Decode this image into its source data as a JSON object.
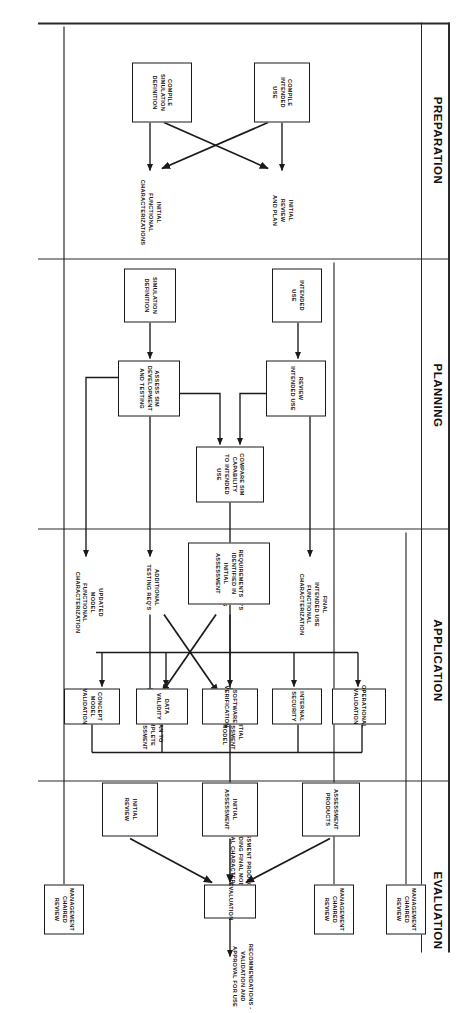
{
  "diagram": {
    "orientation": "rotated-90-clockwise",
    "phases": [
      {
        "id": "preparation",
        "label": "PREPARATION"
      },
      {
        "id": "planning",
        "label": "PLANNING"
      },
      {
        "id": "application",
        "label": "APPLICATION"
      },
      {
        "id": "evaluation",
        "label": "EVALUATION"
      }
    ],
    "review_gates": [
      {
        "id": "gate-preparation",
        "label": "MANAGEMENT\nCHAIRED\nREVIEW"
      },
      {
        "id": "gate-planning",
        "label": "MANAGEMENT\nCHAIRED\nREVIEW"
      },
      {
        "id": "gate-application",
        "label": "MANAGEMENT\nCHAIRED\nREVIEW"
      }
    ],
    "preparation": {
      "boxes": [
        {
          "id": "compile-simulation-definition",
          "label": "COMPILE\nSIMULATION\nDEFINITION"
        },
        {
          "id": "compile-intended-use",
          "label": "COMPILE\nINTENDED\nUSE"
        }
      ],
      "outputs": [
        {
          "id": "initial-functional-characterizations",
          "label": "INITIAL\nFUNCTIONAL\nCHARACTERIZATIONS"
        },
        {
          "id": "initial-review-and-plan",
          "label": "INITIAL\nREVIEW\nAND PLAN"
        }
      ]
    },
    "planning": {
      "boxes": [
        {
          "id": "simulation-definition",
          "label": "SIMULATION\nDEFINITION"
        },
        {
          "id": "intended-use",
          "label": "INTENDED\nUSE"
        },
        {
          "id": "assess-sim-development",
          "label": "ASSESS SIM\nDEVELOPMENT\nAND TESTING"
        },
        {
          "id": "review-intended-use",
          "label": "REVIEW\nINTENDED USE"
        },
        {
          "id": "compare-sim-capability",
          "label": "COMPARE SIM\nCAPABILITY\nTO INTENDED USE"
        }
      ],
      "outputs": [
        {
          "id": "updated-model-functional-characterization",
          "label": "UPDATED\nMODEL\nFUNCTIONAL\nCHARACTERIZATION"
        },
        {
          "id": "additional-testing-reqs",
          "label": "ADDITIONAL\nTESTING REQ'S"
        },
        {
          "id": "testing-reqs-to-meet-objectives",
          "label": "TESTING REQ'S\nTO MEET\nOBJECTIVES"
        },
        {
          "id": "final-intended-use-functional-characterization",
          "label": "FINAL\nINTENDED USE\nFUNCTIONAL\nCHARACTERIZATION"
        },
        {
          "id": "plan-to-complete-assessment",
          "label": "PLAN TO\nCOMPLETE\nASSESSMENT"
        },
        {
          "id": "initial-assessment-of-model",
          "label": "INITIAL\nASSESSMENT\nOF MODEL"
        }
      ]
    },
    "application": {
      "source": {
        "id": "requirements-identified",
        "label": "REQUIREMENTS IDENTIFIED IN\nINITIAL ASSESSMENT"
      },
      "boxes": [
        {
          "id": "concept-model-validation",
          "label": "CONCEPT MODEL\nVALIDATION"
        },
        {
          "id": "data-validity",
          "label": "DATA\nVALIDITY"
        },
        {
          "id": "software-verification",
          "label": "SOFTWARE\nVERIFICATION"
        },
        {
          "id": "internal-security",
          "label": "INTERNAL\nSECURITY"
        },
        {
          "id": "operational-validation",
          "label": "OPERATIONAL\nVALIDATION"
        }
      ],
      "output": {
        "id": "assessment-products",
        "label": "ASSESSMENT PRODUCTS\nINCLUDING FINAL MODEL\nFUNCTIONAL CHARACTERIZATION"
      }
    },
    "evaluation": {
      "inputs": [
        {
          "id": "initial-review",
          "label": "INITIAL\nREVIEW"
        },
        {
          "id": "initial-assessment",
          "label": "INITIAL\nASSESSMENT"
        },
        {
          "id": "assessment-products-in",
          "label": "ASSESSMENT\nPRODUCTS"
        }
      ],
      "process": {
        "id": "evaluation-box",
        "label": "EVALUATION"
      },
      "output": {
        "id": "recommendations",
        "label": "RECOMMENDATIONS -\nVALIDATION AND\nAPPROVAL FOR USE"
      }
    },
    "colors": {
      "stroke": "#1a1a1a",
      "background": "#ffffff",
      "text": "#111111"
    }
  }
}
